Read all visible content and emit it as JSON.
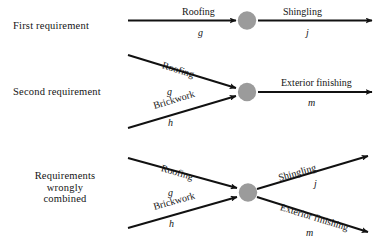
{
  "diagram": {
    "node_color": "#9b9b9b",
    "line_color": "#111111",
    "background": "#ffffff",
    "rows": [
      {
        "id": "first-requirement",
        "label": "First requirement",
        "incoming": [
          {
            "name": "Roofing",
            "var": "g"
          }
        ],
        "outgoing": [
          {
            "name": "Shingling",
            "var": "j"
          }
        ]
      },
      {
        "id": "second-requirement",
        "label": "Second requirement",
        "incoming": [
          {
            "name": "Roofing",
            "var": "g"
          },
          {
            "name": "Brickwork",
            "var": "h"
          }
        ],
        "outgoing": [
          {
            "name": "Exterior finishing",
            "var": "m"
          }
        ]
      },
      {
        "id": "requirements-wrongly-combined",
        "label": "Requirements wrongly combined",
        "label_lines": [
          "Requirements",
          "wrongly",
          "combined"
        ],
        "incoming": [
          {
            "name": "Roofing",
            "var": "g"
          },
          {
            "name": "Brickwork",
            "var": "h"
          }
        ],
        "outgoing": [
          {
            "name": "Shingling",
            "var": "j"
          },
          {
            "name": "Exterior finishing",
            "var": "m"
          }
        ]
      }
    ]
  }
}
